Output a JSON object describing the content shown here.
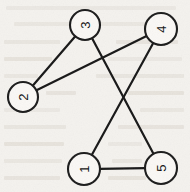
{
  "figure": {
    "width": 190,
    "height": 192,
    "background_color": "#f4f2ee",
    "ink_color": "#161616",
    "node_fill_color": "#faf8f5",
    "label_rotation_degrees": -90
  },
  "chart_data": {
    "type": "diagram",
    "diagram_type": "node-link-graph",
    "directed": false,
    "title": "",
    "node_count": 5,
    "edge_count": 5,
    "nodes": [
      {
        "id": "2",
        "label": "2",
        "x": 23,
        "y": 97,
        "r": 15
      },
      {
        "id": "3",
        "label": "3",
        "x": 85,
        "y": 25,
        "r": 15
      },
      {
        "id": "4",
        "label": "4",
        "x": 161,
        "y": 29,
        "r": 16
      },
      {
        "id": "1",
        "label": "1",
        "x": 84,
        "y": 169,
        "r": 16
      },
      {
        "id": "5",
        "label": "5",
        "x": 161,
        "y": 168,
        "r": 16
      }
    ],
    "edges": [
      {
        "source": "2",
        "target": "3"
      },
      {
        "source": "2",
        "target": "4"
      },
      {
        "source": "3",
        "target": "5"
      },
      {
        "source": "4",
        "target": "1"
      },
      {
        "source": "1",
        "target": "5"
      }
    ],
    "adjacency": {
      "1": [
        "4",
        "5"
      ],
      "2": [
        "3",
        "4"
      ],
      "3": [
        "2",
        "5"
      ],
      "4": [
        "2",
        "1"
      ],
      "5": [
        "3",
        "1"
      ]
    },
    "crossings": [
      {
        "edge_a": "2-4",
        "edge_b": "3-5",
        "x": 113,
        "y": 60
      },
      {
        "edge_a": "3-5",
        "edge_b": "4-1",
        "x": 122,
        "y": 104
      }
    ]
  },
  "bleed_marks": [
    {
      "x": 6,
      "y": 6,
      "w": 170,
      "h": 4
    },
    {
      "x": 14,
      "y": 22,
      "w": 150,
      "h": 4
    },
    {
      "x": 4,
      "y": 40,
      "w": 56,
      "h": 4
    },
    {
      "x": 116,
      "y": 40,
      "w": 62,
      "h": 4
    },
    {
      "x": 4,
      "y": 57,
      "w": 48,
      "h": 4
    },
    {
      "x": 108,
      "y": 57,
      "w": 74,
      "h": 4
    },
    {
      "x": 4,
      "y": 74,
      "w": 34,
      "h": 4
    },
    {
      "x": 96,
      "y": 74,
      "w": 88,
      "h": 4
    },
    {
      "x": 46,
      "y": 91,
      "w": 30,
      "h": 4
    },
    {
      "x": 128,
      "y": 91,
      "w": 56,
      "h": 4
    },
    {
      "x": 4,
      "y": 108,
      "w": 56,
      "h": 4
    },
    {
      "x": 140,
      "y": 108,
      "w": 44,
      "h": 4
    },
    {
      "x": 4,
      "y": 125,
      "w": 62,
      "h": 4
    },
    {
      "x": 118,
      "y": 125,
      "w": 66,
      "h": 4
    },
    {
      "x": 4,
      "y": 142,
      "w": 60,
      "h": 4
    },
    {
      "x": 108,
      "y": 142,
      "w": 34,
      "h": 4
    },
    {
      "x": 4,
      "y": 159,
      "w": 58,
      "h": 4
    },
    {
      "x": 112,
      "y": 159,
      "w": 30,
      "h": 4
    },
    {
      "x": 4,
      "y": 176,
      "w": 56,
      "h": 4
    },
    {
      "x": 108,
      "y": 176,
      "w": 38,
      "h": 4
    }
  ]
}
